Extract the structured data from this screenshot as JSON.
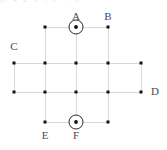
{
  "figure": {
    "title": "",
    "clipped_header_text": "B  4  2  0  ,  F  ?  0"
  },
  "colors": {
    "wire": "#d9d9d9",
    "node": "#121212",
    "symbol_stroke": "#2a2a2a",
    "label_text": "#4a4a4a",
    "background": "#ffffff"
  },
  "chart_data": {
    "type": "diagram",
    "title": "",
    "xlabel": "",
    "ylabel": "",
    "xlim": [
      0,
      167
    ],
    "ylim": [
      0,
      150
    ],
    "grid": true,
    "legend": "none",
    "columns_x": [
      14,
      45,
      76,
      108,
      141
    ],
    "rows_y": [
      27,
      63,
      92,
      122
    ],
    "nodes": [
      {
        "id": "n-r1c2",
        "x": 45,
        "y": 27,
        "symbol": "dot"
      },
      {
        "id": "n-r1c3",
        "x": 76,
        "y": 27,
        "symbol": "current-out"
      },
      {
        "id": "n-r1c4",
        "x": 108,
        "y": 27,
        "symbol": "dot"
      },
      {
        "id": "n-r2c1",
        "x": 14,
        "y": 63,
        "symbol": "dot"
      },
      {
        "id": "n-r2c2",
        "x": 45,
        "y": 63,
        "symbol": "dot"
      },
      {
        "id": "n-r2c3",
        "x": 76,
        "y": 63,
        "symbol": "dot"
      },
      {
        "id": "n-r2c4",
        "x": 108,
        "y": 63,
        "symbol": "dot"
      },
      {
        "id": "n-r2c5",
        "x": 141,
        "y": 63,
        "symbol": "dot"
      },
      {
        "id": "n-r3c1",
        "x": 14,
        "y": 92,
        "symbol": "dot"
      },
      {
        "id": "n-r3c2",
        "x": 45,
        "y": 92,
        "symbol": "dot"
      },
      {
        "id": "n-r3c3",
        "x": 76,
        "y": 92,
        "symbol": "dot"
      },
      {
        "id": "n-r3c4",
        "x": 108,
        "y": 92,
        "symbol": "dot"
      },
      {
        "id": "n-r3c5",
        "x": 141,
        "y": 92,
        "symbol": "dot"
      },
      {
        "id": "n-r4c2",
        "x": 45,
        "y": 122,
        "symbol": "dot"
      },
      {
        "id": "n-r4c3",
        "x": 76,
        "y": 122,
        "symbol": "current-out"
      },
      {
        "id": "n-r4c4",
        "x": 108,
        "y": 122,
        "symbol": "dot"
      }
    ],
    "segments": [
      {
        "id": "h-row1",
        "x1": 45,
        "y1": 27,
        "x2": 108,
        "y2": 27
      },
      {
        "id": "h-row2",
        "x1": 14,
        "y1": 63,
        "x2": 141,
        "y2": 63
      },
      {
        "id": "h-row3",
        "x1": 14,
        "y1": 92,
        "x2": 141,
        "y2": 92
      },
      {
        "id": "h-row4",
        "x1": 45,
        "y1": 122,
        "x2": 108,
        "y2": 122
      },
      {
        "id": "v-col1",
        "x1": 14,
        "y1": 63,
        "x2": 14,
        "y2": 92
      },
      {
        "id": "v-col2",
        "x1": 45,
        "y1": 27,
        "x2": 45,
        "y2": 122
      },
      {
        "id": "v-col3",
        "x1": 76,
        "y1": 27,
        "x2": 76,
        "y2": 122
      },
      {
        "id": "v-col4",
        "x1": 108,
        "y1": 27,
        "x2": 108,
        "y2": 122
      },
      {
        "id": "v-col5",
        "x1": 141,
        "y1": 63,
        "x2": 141,
        "y2": 92
      }
    ],
    "current_symbols": [
      {
        "id": "current-a",
        "label": "A",
        "x": 76,
        "y": 27,
        "radius": 7,
        "direction": "out-of-page"
      },
      {
        "id": "current-f",
        "label": "F",
        "x": 76,
        "y": 122,
        "radius": 7,
        "direction": "out-of-page"
      }
    ],
    "labels": [
      {
        "id": "label-a",
        "text": "A",
        "x": 76,
        "y": 17,
        "anchor": "center",
        "target": "n-r1c3"
      },
      {
        "id": "label-b",
        "text": "B",
        "x": 108,
        "y": 17,
        "anchor": "center",
        "target": "n-r1c4"
      },
      {
        "id": "label-c",
        "text": "C",
        "x": 14,
        "y": 47,
        "anchor": "center",
        "target": "n-r2c1"
      },
      {
        "id": "label-d",
        "text": "D",
        "x": 155,
        "y": 92,
        "anchor": "center",
        "target": "n-r3c5"
      },
      {
        "id": "label-e",
        "text": "E",
        "x": 45,
        "y": 136,
        "anchor": "center",
        "target": "n-r4c2"
      },
      {
        "id": "label-f",
        "text": "F",
        "x": 76,
        "y": 136,
        "anchor": "center",
        "target": "n-r4c3"
      }
    ]
  }
}
